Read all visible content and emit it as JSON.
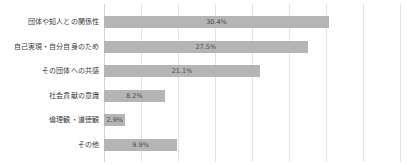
{
  "chart_data": {
    "type": "bar",
    "orientation": "horizontal",
    "title": "",
    "subtitle": "",
    "xlabel": "",
    "ylabel": "",
    "xlim": [
      0,
      40
    ],
    "grid": true,
    "gridline_values": [
      0,
      5,
      10,
      15,
      20,
      25,
      30,
      35,
      40
    ],
    "legend": false,
    "legend_position": "none",
    "bar_color": "#b5b5b5",
    "background_color": "#ffffff",
    "gridline_color": "#e3e3e3",
    "value_suffix": "%",
    "categories": [
      "団体や知人との関係性",
      "自己実現・自分自身のため",
      "その団体への共感",
      "社会貢献の意識",
      "倫理観・道徳観",
      "その他"
    ],
    "values": [
      30.4,
      27.5,
      21.1,
      8.2,
      2.9,
      9.9
    ],
    "value_labels": [
      "30.4%",
      "27.5%",
      "21.1%",
      "8.2%",
      "2.9%",
      "9.9%"
    ]
  }
}
